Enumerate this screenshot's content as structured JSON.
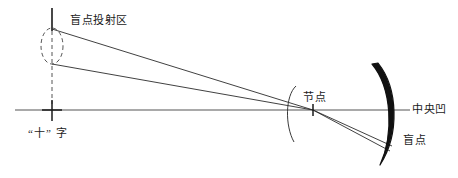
{
  "diagram": {
    "colors": {
      "ink": "#1a1a1a",
      "ray": "#2b2b2b",
      "axis": "#555555",
      "retina": "#111111",
      "background": "#ffffff"
    },
    "labels": {
      "blind_spot_projection_area": "盲点投射区",
      "cross_character": "“十” 字",
      "nodal_point": "节点",
      "fovea": "中央凹",
      "blind_spot": "盲点"
    },
    "elements": {
      "object_line": "vertical-object-line",
      "projection_ellipse": "dashed-ellipse-blind-spot-projection",
      "dashed_drop_line": "dashed-vertical-drop-line",
      "optical_axis": "horizontal-optical-axis",
      "cross_mark": "cross-fixation-mark",
      "nodal_tick": "nodal-point-tick",
      "cornea_arc": "thin-cornea-arc",
      "retina_arc": "thick-retina-arc",
      "ray_upper": "chief-ray-upper",
      "ray_lower": "chief-ray-lower"
    }
  }
}
